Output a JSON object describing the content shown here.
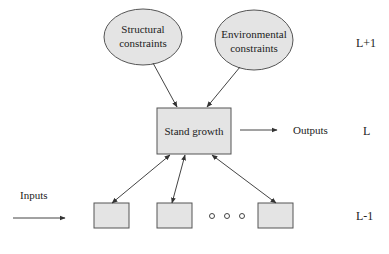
{
  "diagram": {
    "levels": {
      "upper": "L+1",
      "middle": "L",
      "lower": "L-1"
    },
    "nodes": {
      "structural": {
        "line1": "Structural",
        "line2": "constraints"
      },
      "environmental": {
        "line1": "Environmental",
        "line2": "constraints"
      },
      "stand_growth": {
        "label": "Stand growth"
      }
    },
    "io": {
      "inputs": "Inputs",
      "outputs": "Outputs"
    },
    "ellipsis_marker": "○ ○ ○",
    "colors": {
      "node_fill": "#e4e4e4",
      "stroke": "#555555",
      "text": "#222222"
    }
  }
}
